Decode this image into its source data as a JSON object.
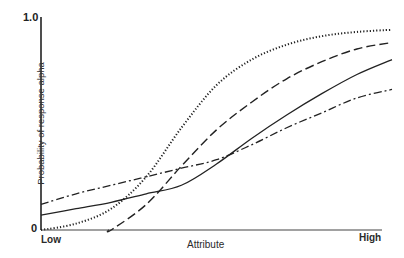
{
  "chart_data": {
    "type": "line",
    "title": "",
    "xlabel": "Attribute",
    "ylabel": "Probability of response alpha",
    "x_tick_labels": [
      "Low",
      "High"
    ],
    "y_tick_labels": [
      "0",
      "1.0"
    ],
    "ylim": [
      0,
      1.0
    ],
    "xlim": [
      0,
      1
    ],
    "grid": false,
    "legend": null,
    "x": [
      0.0,
      0.1,
      0.2,
      0.3,
      0.4,
      0.5,
      0.6,
      0.7,
      0.8,
      0.9,
      1.0
    ],
    "series": [
      {
        "name": "dotted curve",
        "style": "dotted",
        "values": [
          0.0,
          0.03,
          0.1,
          0.25,
          0.48,
          0.68,
          0.8,
          0.87,
          0.91,
          0.93,
          0.94
        ]
      },
      {
        "name": "dashed curve",
        "style": "dashed",
        "values": [
          null,
          null,
          0.0,
          0.12,
          0.3,
          0.47,
          0.6,
          0.71,
          0.79,
          0.85,
          0.88
        ]
      },
      {
        "name": "solid curve",
        "style": "solid",
        "values": [
          0.07,
          0.1,
          0.13,
          0.17,
          0.21,
          0.31,
          0.43,
          0.54,
          0.64,
          0.73,
          0.8
        ]
      },
      {
        "name": "dash-dot curve",
        "style": "dash-dot",
        "values": [
          0.12,
          0.17,
          0.21,
          0.25,
          0.29,
          0.33,
          0.4,
          0.48,
          0.55,
          0.62,
          0.66
        ]
      }
    ]
  },
  "axes": {
    "y_top": "1.0",
    "y_bottom": "0",
    "x_left": "Low",
    "x_right": "High",
    "x_title": "Attribute",
    "y_title": "Probability of response alpha"
  }
}
